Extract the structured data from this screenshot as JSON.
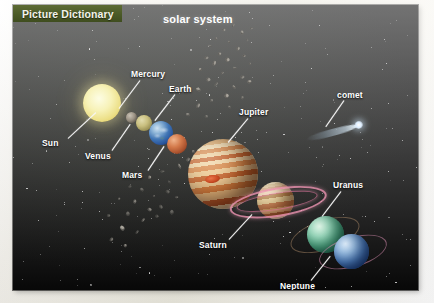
{
  "banner": {
    "label": "Picture Dictionary",
    "color": "#4b5a27"
  },
  "title": "solar system",
  "panel": {
    "background": "#050505",
    "label_color": "#ffffff"
  },
  "labels": [
    {
      "name": "sun",
      "text": "Sun",
      "x": 42,
      "y": 138,
      "line": {
        "x1": 68,
        "y1": 138,
        "x2": 96,
        "y2": 112
      }
    },
    {
      "name": "mercury",
      "text": "Mercury",
      "x": 131,
      "y": 69,
      "line": {
        "x1": 140,
        "y1": 80,
        "x2": 119,
        "y2": 108
      }
    },
    {
      "name": "venus",
      "text": "Venus",
      "x": 85,
      "y": 151,
      "line": {
        "x1": 112,
        "y1": 150,
        "x2": 130,
        "y2": 124
      }
    },
    {
      "name": "earth",
      "text": "Earth",
      "x": 169,
      "y": 84,
      "line": {
        "x1": 175,
        "y1": 94,
        "x2": 155,
        "y2": 120
      }
    },
    {
      "name": "mars",
      "text": "Mars",
      "x": 122,
      "y": 170,
      "line": {
        "x1": 148,
        "y1": 170,
        "x2": 164,
        "y2": 146
      }
    },
    {
      "name": "jupiter",
      "text": "Jupiter",
      "x": 239,
      "y": 107,
      "line": {
        "x1": 248,
        "y1": 118,
        "x2": 228,
        "y2": 142
      }
    },
    {
      "name": "comet",
      "text": "comet",
      "x": 337,
      "y": 90,
      "line": {
        "x1": 344,
        "y1": 100,
        "x2": 326,
        "y2": 126
      }
    },
    {
      "name": "saturn",
      "text": "Saturn",
      "x": 199,
      "y": 240,
      "line": {
        "x1": 229,
        "y1": 239,
        "x2": 252,
        "y2": 214
      }
    },
    {
      "name": "uranus",
      "text": "Uranus",
      "x": 333,
      "y": 180,
      "line": {
        "x1": 341,
        "y1": 191,
        "x2": 322,
        "y2": 216
      }
    },
    {
      "name": "neptune",
      "text": "Neptune",
      "x": 280,
      "y": 281,
      "line": {
        "x1": 311,
        "y1": 280,
        "x2": 330,
        "y2": 256
      }
    }
  ],
  "bodies": [
    {
      "name": "sun",
      "kind": "star",
      "color": "#f3ecb0"
    },
    {
      "name": "mercury",
      "kind": "planet",
      "color": "#9b9284"
    },
    {
      "name": "venus",
      "kind": "planet",
      "color": "#c9bf7f"
    },
    {
      "name": "earth",
      "kind": "planet",
      "color": "#3f74b4"
    },
    {
      "name": "mars",
      "kind": "planet",
      "color": "#d3794a"
    },
    {
      "name": "jupiter",
      "kind": "planet",
      "color": "#e3b272"
    },
    {
      "name": "saturn",
      "kind": "planet",
      "color": "#dcc999",
      "ring_color": "#f096b4"
    },
    {
      "name": "uranus",
      "kind": "planet",
      "color": "#5cb892",
      "ring_color": "#c8a078"
    },
    {
      "name": "neptune",
      "kind": "planet",
      "color": "#5a8fd0",
      "ring_color": "#d78caf"
    },
    {
      "name": "comet",
      "kind": "comet",
      "color": "#ddeeff"
    },
    {
      "name": "asteroid-belt",
      "kind": "debris",
      "color": "#b9b4aa"
    }
  ]
}
